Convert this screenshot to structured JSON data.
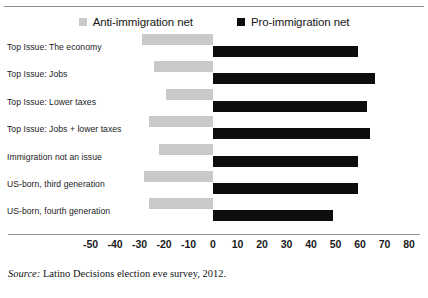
{
  "chart_data": {
    "type": "bar",
    "orientation": "horizontal",
    "title": "",
    "xlabel": "",
    "ylabel": "",
    "xlim": [
      -50,
      80
    ],
    "xticks": [
      -50,
      -40,
      -30,
      -20,
      -10,
      0,
      10,
      20,
      30,
      40,
      50,
      60,
      70,
      80
    ],
    "grid": false,
    "legend_position": "top-center",
    "categories": [
      "Top Issue: The economy",
      "Top Issue: Jobs",
      "Top Issue: Lower taxes",
      "Top Issue: Jobs + lower taxes",
      "Immigration not an issue",
      "US-born, third generation",
      "US-born, fourth generation"
    ],
    "series": [
      {
        "name": "Anti-immigration net",
        "color": "#c9c9c9",
        "values": [
          -29,
          -24,
          -19,
          -26,
          -22,
          -28,
          -26
        ]
      },
      {
        "name": "Pro-immigration net",
        "color": "#0d0d0d",
        "values": [
          59,
          66,
          63,
          64,
          59,
          59,
          49
        ]
      }
    ]
  },
  "legend": {
    "items": [
      {
        "label": "Anti-immigration net",
        "color": "#c9c9c9"
      },
      {
        "label": "Pro-immigration net",
        "color": "#0d0d0d"
      }
    ]
  },
  "source": {
    "prefix": "Source:",
    "text": " Latino Decisions election eve survey, 2012."
  }
}
